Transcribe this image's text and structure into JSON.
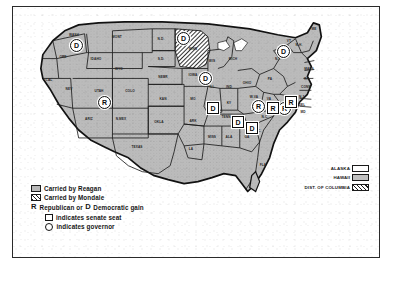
{
  "figure": {
    "frame_color": "#2a2a2a",
    "background": "#ffffff"
  },
  "legend": {
    "items": [
      {
        "swatch": "gray-fill-swatch",
        "label": "Carried by Reagan"
      },
      {
        "swatch": "hatched-swatch",
        "label": "Carried by Mondale"
      }
    ],
    "gain_line": {
      "r_char": "R",
      "text_before": "Republican or",
      "d_char": "D",
      "text_after": "Democratic gain"
    },
    "senate_line": {
      "mark": "square-outline-icon",
      "label": "indicates  senate seat"
    },
    "governor_line": {
      "mark": "circle-outline-icon",
      "label": "indicates  governor"
    }
  },
  "territory_key": {
    "rows": [
      {
        "label": "ALASKA",
        "swatch": "plain"
      },
      {
        "label": "HAWAII",
        "swatch": "gray"
      },
      {
        "label": "DIST. OF COLUMBIA",
        "swatch": "hatch"
      }
    ]
  },
  "caption": {
    "left": "",
    "right": ""
  },
  "colors": {
    "reagan_fill": "#b9b9b9",
    "mondale_hatch": "#1d1d1d",
    "ink": "#1a1a1a",
    "paper": "#ffffff"
  },
  "map": {
    "state_labels": [
      {
        "abbr": "WASH",
        "x": 61,
        "y": 28
      },
      {
        "abbr": "ORE",
        "x": 50,
        "y": 50
      },
      {
        "abbr": "MONT",
        "x": 104,
        "y": 30
      },
      {
        "abbr": "IDAHO",
        "x": 83,
        "y": 52
      },
      {
        "abbr": "N.D.",
        "x": 148,
        "y": 32
      },
      {
        "abbr": "MINN",
        "x": 180,
        "y": 42
      },
      {
        "abbr": "S.D.",
        "x": 148,
        "y": 52
      },
      {
        "abbr": "WYO",
        "x": 106,
        "y": 62
      },
      {
        "abbr": "CAL",
        "x": 36,
        "y": 73
      },
      {
        "abbr": "NEV",
        "x": 56,
        "y": 82
      },
      {
        "abbr": "UTAH",
        "x": 86,
        "y": 84
      },
      {
        "abbr": "COLO",
        "x": 117,
        "y": 84
      },
      {
        "abbr": "NEBR",
        "x": 150,
        "y": 70
      },
      {
        "abbr": "IOWA",
        "x": 180,
        "y": 68
      },
      {
        "abbr": "WIS",
        "x": 199,
        "y": 54
      },
      {
        "abbr": "MICH",
        "x": 220,
        "y": 52
      },
      {
        "abbr": "ILL",
        "x": 199,
        "y": 80
      },
      {
        "abbr": "IND",
        "x": 216,
        "y": 80
      },
      {
        "abbr": "OHIO",
        "x": 234,
        "y": 76
      },
      {
        "abbr": "PA",
        "x": 257,
        "y": 72
      },
      {
        "abbr": "N.Y.",
        "x": 265,
        "y": 52
      },
      {
        "abbr": "KAN",
        "x": 150,
        "y": 92
      },
      {
        "abbr": "MO",
        "x": 180,
        "y": 92
      },
      {
        "abbr": "KY",
        "x": 216,
        "y": 96
      },
      {
        "abbr": "W.VA",
        "x": 241,
        "y": 90
      },
      {
        "abbr": "VA",
        "x": 256,
        "y": 92
      },
      {
        "abbr": "ARIZ",
        "x": 76,
        "y": 112
      },
      {
        "abbr": "N.MEX",
        "x": 108,
        "y": 112
      },
      {
        "abbr": "OKLA",
        "x": 146,
        "y": 115
      },
      {
        "abbr": "ARK",
        "x": 180,
        "y": 114
      },
      {
        "abbr": "TENN",
        "x": 213,
        "y": 110
      },
      {
        "abbr": "N.C.",
        "x": 252,
        "y": 110
      },
      {
        "abbr": "S.C.",
        "x": 245,
        "y": 124
      },
      {
        "abbr": "TEXAS",
        "x": 124,
        "y": 140
      },
      {
        "abbr": "LA",
        "x": 178,
        "y": 142
      },
      {
        "abbr": "MISS",
        "x": 199,
        "y": 130
      },
      {
        "abbr": "ALA",
        "x": 216,
        "y": 130
      },
      {
        "abbr": "GA",
        "x": 234,
        "y": 130
      },
      {
        "abbr": "FLA",
        "x": 250,
        "y": 158
      },
      {
        "abbr": "MASS",
        "x": 296,
        "y": 62
      },
      {
        "abbr": "R.I.",
        "x": 294,
        "y": 72
      },
      {
        "abbr": "CONN",
        "x": 293,
        "y": 80
      },
      {
        "abbr": "N.J.",
        "x": 289,
        "y": 90
      },
      {
        "abbr": "DEL",
        "x": 289,
        "y": 98
      },
      {
        "abbr": "MD",
        "x": 290,
        "y": 105
      },
      {
        "abbr": "ME",
        "x": 301,
        "y": 22
      },
      {
        "abbr": "N.H.",
        "x": 286,
        "y": 38
      },
      {
        "abbr": "VT",
        "x": 276,
        "y": 34
      }
    ],
    "markers": [
      {
        "id": "marker-wa",
        "type": "circle",
        "letter": "D",
        "x": 63,
        "y": 38
      },
      {
        "id": "marker-nd",
        "type": "circle",
        "letter": "D",
        "x": 170,
        "y": 31
      },
      {
        "id": "marker-ut",
        "type": "circle",
        "letter": "R",
        "x": 91,
        "y": 95
      },
      {
        "id": "marker-vt",
        "type": "circle",
        "letter": "D",
        "x": 270,
        "y": 44
      },
      {
        "id": "marker-ia",
        "type": "circle",
        "letter": "D",
        "x": 192,
        "y": 71
      },
      {
        "id": "marker-il",
        "type": "box",
        "letter": "D",
        "x": 199,
        "y": 100
      },
      {
        "id": "marker-ky",
        "type": "box",
        "letter": "D",
        "x": 224,
        "y": 114
      },
      {
        "id": "marker-wv",
        "type": "circle",
        "letter": "R",
        "x": 245,
        "y": 99
      },
      {
        "id": "marker-nc",
        "type": "circle",
        "letter": "R",
        "x": 271,
        "y": 101
      },
      {
        "id": "marker-va",
        "type": "box",
        "letter": "R",
        "x": 259,
        "y": 100
      },
      {
        "id": "marker-ga",
        "type": "box",
        "letter": "D",
        "x": 238,
        "y": 120
      },
      {
        "id": "marker-nj",
        "type": "box",
        "letter": "R",
        "x": 277,
        "y": 94
      }
    ]
  }
}
